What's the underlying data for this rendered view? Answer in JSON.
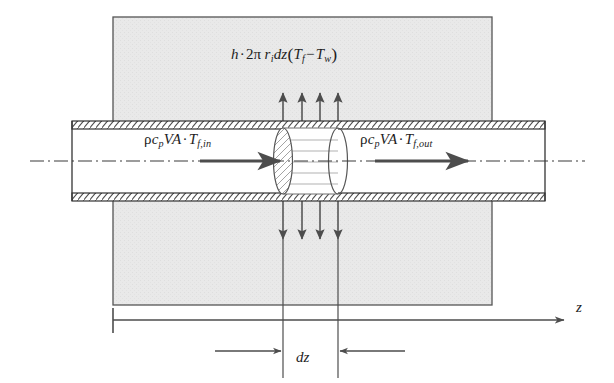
{
  "figure": {
    "domain": "engineering-diagram",
    "canvas": {
      "width": 614,
      "height": 383,
      "background": "#ffffff"
    }
  },
  "colors": {
    "background": "#ffffff",
    "solid_block_fill": "#e8e8e8",
    "solid_block_stroke": "#4a4a4a",
    "pipe_fill": "#ffffff",
    "pipe_wall_stroke": "#333333",
    "pipe_wall_hatch": "#555555",
    "arrow": "#4d4d4d",
    "centerline": "#3a3a3a",
    "control_volume_hatch": "#8a8a8a",
    "text": "#1d1d1d"
  },
  "labels": {
    "heat_flux": {
      "name": "convective-heat-transfer-term",
      "plain": "h·2π r_i dz(T_f − T_w)",
      "parts": {
        "h": "h",
        "dot1": "·",
        "two": "2",
        "pi": "π",
        "r": "r",
        "r_sub": "i",
        "dz": "dz",
        "open": "(",
        "T1": "T",
        "T1_sub": "f",
        "minus": "−",
        "T2": "T",
        "T2_sub": "w",
        "close": ")"
      }
    },
    "flow_in": {
      "name": "inlet-enthalpy-flow-term",
      "plain": "ρc_p VA · T_f,in",
      "parts": {
        "rho": "ρ",
        "c": "c",
        "c_sub": "p",
        "V": "V",
        "A": "A",
        "dot": "·",
        "T": "T",
        "T_sub": "f,in"
      }
    },
    "flow_out": {
      "name": "outlet-enthalpy-flow-term",
      "plain": "ρc_p VA · T_f,out",
      "parts": {
        "rho": "ρ",
        "c": "c",
        "c_sub": "p",
        "V": "V",
        "A": "A",
        "dot": "·",
        "T": "T",
        "T_sub": "f,out"
      }
    },
    "dz": {
      "name": "differential-length-label",
      "text": "dz"
    },
    "z_axis": {
      "name": "axial-coordinate-label",
      "text": "z"
    }
  },
  "geometry": {
    "solid_block": {
      "x": 113,
      "y": 17,
      "width": 379,
      "height": 288
    },
    "pipe": {
      "x_left": 72,
      "x_right": 545,
      "wall_top_outer_y": 121,
      "wall_top_inner_y": 129,
      "wall_bottom_inner_y": 193,
      "wall_bottom_outer_y": 201,
      "centerline_y": 161
    },
    "control_volume": {
      "left_face_x": 283,
      "right_face_x": 338,
      "ellipse_ry": 33,
      "ellipse_rx": 9,
      "interior_line_count": 5
    },
    "heat_arrows": {
      "x_positions": [
        283,
        302,
        320,
        338
      ],
      "up_tail_y": 121,
      "up_head_y": 91,
      "down_tail_y": 201,
      "down_head_y": 241,
      "count_up": 4,
      "count_down": 4
    },
    "flow_arrows": {
      "inlet": {
        "x1": 200,
        "x2": 283,
        "y": 161
      },
      "outlet": {
        "x1": 375,
        "x2": 470,
        "y": 161
      }
    },
    "z_axis": {
      "x1": 113,
      "x2": 566,
      "y": 320,
      "tick_top": 308,
      "tick_bottom": 332
    },
    "dz_dimension": {
      "y": 351,
      "left_arrow": {
        "from_x": 215,
        "to_x": 283
      },
      "right_arrow": {
        "from_x": 405,
        "to_x": 338
      },
      "extension_left_x": 283,
      "extension_right_x": 338,
      "extension_top_y": 241,
      "extension_bottom_y": 378
    }
  }
}
